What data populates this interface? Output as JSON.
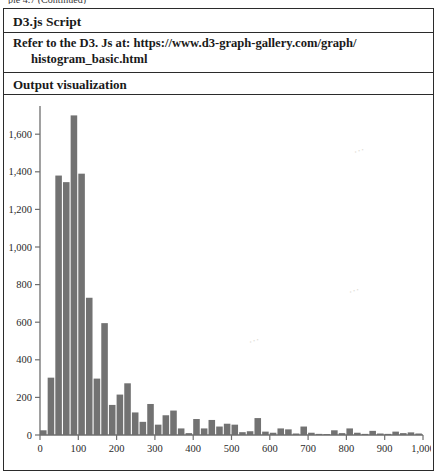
{
  "page": {
    "cut_top_text": "ple 4.7 (Continued)"
  },
  "table": {
    "rows": [
      {
        "name": "script-header",
        "label": "D3.js Script"
      },
      {
        "name": "reference-text",
        "line1": "Refer to the D3. Js at: https://www.d3-graph-gallery.com/graph/",
        "line2": "histogram_basic.html"
      },
      {
        "name": "output-header",
        "label": "Output visualization"
      }
    ]
  },
  "chart_data": {
    "type": "bar",
    "title": "",
    "xlabel": "",
    "ylabel": "",
    "xlim": [
      0,
      1000
    ],
    "ylim": [
      0,
      1750
    ],
    "grid": false,
    "legend": null,
    "bar_color": "#727272",
    "axis_color": "#6e6e6e",
    "xticks": [
      0,
      100,
      200,
      300,
      400,
      500,
      600,
      700,
      800,
      900,
      1000
    ],
    "xtick_labels": [
      "0",
      "100",
      "200",
      "300",
      "400",
      "500",
      "600",
      "700",
      "800",
      "900",
      "1,000"
    ],
    "yticks": [
      0,
      200,
      400,
      600,
      800,
      1000,
      1200,
      1400,
      1600
    ],
    "ytick_labels": [
      "0",
      "200",
      "400",
      "600",
      "800",
      "1,000",
      "1,200",
      "1,400",
      "1,600"
    ],
    "bin_width": 20,
    "bins": [
      {
        "x0": 0,
        "x1": 20,
        "count": 25
      },
      {
        "x0": 20,
        "x1": 40,
        "count": 305
      },
      {
        "x0": 40,
        "x1": 60,
        "count": 1380
      },
      {
        "x0": 60,
        "x1": 80,
        "count": 1345
      },
      {
        "x0": 80,
        "x1": 100,
        "count": 1700
      },
      {
        "x0": 100,
        "x1": 120,
        "count": 1390
      },
      {
        "x0": 120,
        "x1": 140,
        "count": 730
      },
      {
        "x0": 140,
        "x1": 160,
        "count": 300
      },
      {
        "x0": 160,
        "x1": 180,
        "count": 595
      },
      {
        "x0": 180,
        "x1": 200,
        "count": 160
      },
      {
        "x0": 200,
        "x1": 220,
        "count": 215
      },
      {
        "x0": 220,
        "x1": 240,
        "count": 275
      },
      {
        "x0": 240,
        "x1": 260,
        "count": 120
      },
      {
        "x0": 260,
        "x1": 280,
        "count": 70
      },
      {
        "x0": 280,
        "x1": 300,
        "count": 165
      },
      {
        "x0": 300,
        "x1": 320,
        "count": 55
      },
      {
        "x0": 320,
        "x1": 340,
        "count": 105
      },
      {
        "x0": 340,
        "x1": 360,
        "count": 130
      },
      {
        "x0": 360,
        "x1": 380,
        "count": 35
      },
      {
        "x0": 380,
        "x1": 400,
        "count": 10
      },
      {
        "x0": 400,
        "x1": 420,
        "count": 85
      },
      {
        "x0": 420,
        "x1": 440,
        "count": 35
      },
      {
        "x0": 440,
        "x1": 460,
        "count": 80
      },
      {
        "x0": 460,
        "x1": 480,
        "count": 45
      },
      {
        "x0": 480,
        "x1": 500,
        "count": 60
      },
      {
        "x0": 500,
        "x1": 520,
        "count": 55
      },
      {
        "x0": 520,
        "x1": 540,
        "count": 15
      },
      {
        "x0": 540,
        "x1": 560,
        "count": 20
      },
      {
        "x0": 560,
        "x1": 580,
        "count": 90
      },
      {
        "x0": 580,
        "x1": 600,
        "count": 18
      },
      {
        "x0": 600,
        "x1": 620,
        "count": 12
      },
      {
        "x0": 620,
        "x1": 640,
        "count": 35
      },
      {
        "x0": 640,
        "x1": 660,
        "count": 30
      },
      {
        "x0": 660,
        "x1": 680,
        "count": 8
      },
      {
        "x0": 680,
        "x1": 700,
        "count": 45
      },
      {
        "x0": 700,
        "x1": 720,
        "count": 12
      },
      {
        "x0": 720,
        "x1": 740,
        "count": 6
      },
      {
        "x0": 740,
        "x1": 760,
        "count": 5
      },
      {
        "x0": 760,
        "x1": 780,
        "count": 25
      },
      {
        "x0": 780,
        "x1": 800,
        "count": 10
      },
      {
        "x0": 800,
        "x1": 820,
        "count": 35
      },
      {
        "x0": 820,
        "x1": 840,
        "count": 12
      },
      {
        "x0": 840,
        "x1": 860,
        "count": 6
      },
      {
        "x0": 860,
        "x1": 880,
        "count": 22
      },
      {
        "x0": 880,
        "x1": 900,
        "count": 8
      },
      {
        "x0": 900,
        "x1": 920,
        "count": 6
      },
      {
        "x0": 920,
        "x1": 940,
        "count": 18
      },
      {
        "x0": 940,
        "x1": 960,
        "count": 10
      },
      {
        "x0": 960,
        "x1": 980,
        "count": 14
      },
      {
        "x0": 980,
        "x1": 1000,
        "count": 8
      }
    ]
  }
}
